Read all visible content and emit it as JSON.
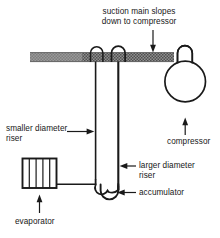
{
  "diagram": {
    "colors": {
      "line": "#1a1a1a",
      "suction_main_fill": "#8c8c8c",
      "suction_main_hatch": "#4a4a4a",
      "background": "#ffffff",
      "text": "#171717"
    },
    "labels": {
      "suction_main": "suction main slopes\ndown to compressor",
      "smaller_riser": "smaller diameter\nriser",
      "larger_riser": "larger diameter\nriser",
      "accumulator": "accumulator",
      "compressor": "compressor",
      "evaporator": "evaporator"
    },
    "components": {
      "suction_main": "suction-main-pipe",
      "compressor_body": "compressor-vessel",
      "compressor_dome": "compressor-dome",
      "smaller_riser": "smaller-diameter-riser-pipe",
      "larger_riser": "larger-diameter-riser-pipe",
      "accumulator": "accumulator-u-bend",
      "evaporator": "evaporator-coil-box",
      "evaporator_fins": 4,
      "riser_arches": 2
    },
    "leaders": {
      "suction_main_arrow": "down-arrow",
      "smaller_riser_arrow": "right-arrow",
      "larger_riser_arrow": "left-arrow",
      "accumulator_arrow": "left-arrow",
      "compressor_arrow": "up-arrow",
      "evaporator_arrow": "up-arrow"
    }
  }
}
